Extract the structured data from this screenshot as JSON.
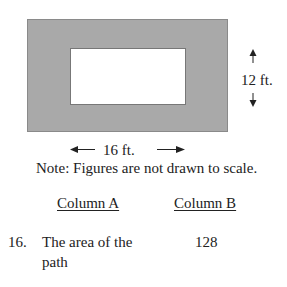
{
  "figure": {
    "outer_fill": "#a9a9a9",
    "outer_stroke": "#8a8a8a",
    "inner_fill": "#ffffff",
    "height_label": "12 ft.",
    "width_label": "16 ft."
  },
  "note": "Note: Figures are not drawn to scale.",
  "columns": {
    "a_header": "Column A",
    "b_header": "Column B"
  },
  "question": {
    "number": "16.",
    "column_a_line1": "The area of the",
    "column_a_line2": "path",
    "column_b": "128"
  }
}
